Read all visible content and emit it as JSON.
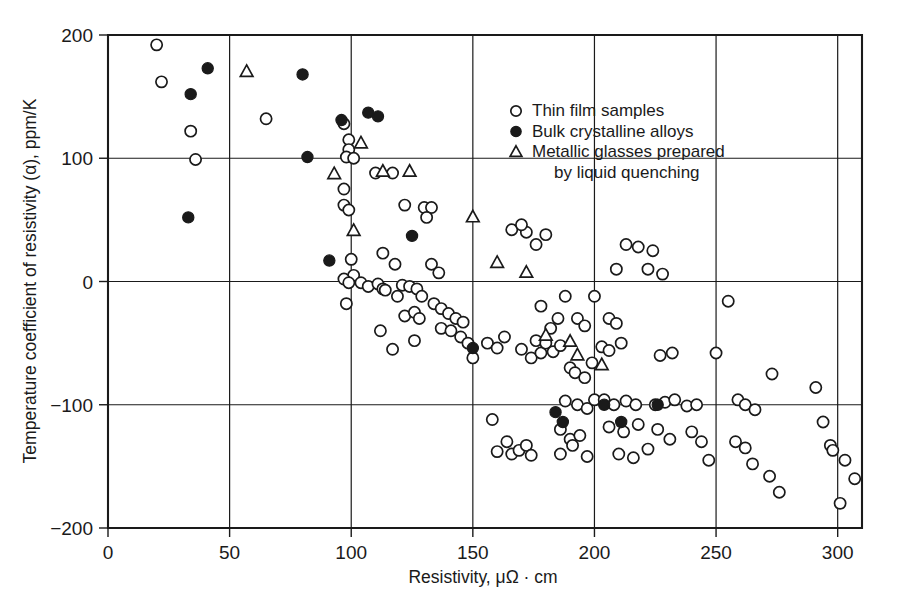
{
  "chart_data": {
    "type": "scatter",
    "title": "",
    "xlabel": "Resistivity, μΩ · cm",
    "ylabel": "Temperature coefficient of resistivity (α), ppm/K",
    "xlim": [
      0,
      310
    ],
    "ylim": [
      -200,
      200
    ],
    "xticks": [
      0,
      50,
      100,
      150,
      200,
      250,
      300
    ],
    "xtick_labels": [
      "0",
      "50",
      "100",
      "150",
      "200",
      "250",
      "300"
    ],
    "yticks": [
      -200,
      -100,
      0,
      100,
      200
    ],
    "ytick_labels": [
      "−200",
      "−100",
      "0",
      "100",
      "200"
    ],
    "grid": true,
    "grid_x": [
      50,
      100,
      150,
      200,
      250,
      300
    ],
    "grid_y": [
      -100,
      0,
      100
    ],
    "legend_position": "upper right",
    "series": [
      {
        "name": "Thin film samples",
        "marker": "open-circle",
        "points": [
          [
            20,
            192
          ],
          [
            22,
            162
          ],
          [
            34,
            122
          ],
          [
            36,
            99
          ],
          [
            65,
            132
          ],
          [
            97,
            128
          ],
          [
            99,
            115
          ],
          [
            99,
            107
          ],
          [
            98,
            101
          ],
          [
            101,
            100
          ],
          [
            97,
            75
          ],
          [
            97,
            62
          ],
          [
            99,
            58
          ],
          [
            100,
            18
          ],
          [
            101,
            5
          ],
          [
            97,
            2
          ],
          [
            99,
            -1
          ],
          [
            104,
            -1
          ],
          [
            98,
            -18
          ],
          [
            107,
            -4
          ],
          [
            111,
            -2
          ],
          [
            113,
            -6
          ],
          [
            110,
            88
          ],
          [
            117,
            88
          ],
          [
            113,
            23
          ],
          [
            118,
            14
          ],
          [
            114,
            -7
          ],
          [
            119,
            -12
          ],
          [
            121,
            -3
          ],
          [
            124,
            -4
          ],
          [
            127,
            -6
          ],
          [
            129,
            -12
          ],
          [
            122,
            62
          ],
          [
            130,
            60
          ],
          [
            133,
            60
          ],
          [
            131,
            52
          ],
          [
            122,
            -28
          ],
          [
            126,
            -25
          ],
          [
            128,
            -30
          ],
          [
            133,
            14
          ],
          [
            136,
            7
          ],
          [
            134,
            -18
          ],
          [
            137,
            -22
          ],
          [
            140,
            -26
          ],
          [
            143,
            -30
          ],
          [
            146,
            -33
          ],
          [
            126,
            -48
          ],
          [
            137,
            -38
          ],
          [
            141,
            -40
          ],
          [
            145,
            -45
          ],
          [
            148,
            -50
          ],
          [
            150,
            -62
          ],
          [
            117,
            -55
          ],
          [
            112,
            -40
          ],
          [
            156,
            -50
          ],
          [
            160,
            -54
          ],
          [
            163,
            -45
          ],
          [
            158,
            -112
          ],
          [
            164,
            -130
          ],
          [
            160,
            -138
          ],
          [
            166,
            -140
          ],
          [
            169,
            -137
          ],
          [
            172,
            -133
          ],
          [
            174,
            -141
          ],
          [
            170,
            -55
          ],
          [
            176,
            -48
          ],
          [
            174,
            -62
          ],
          [
            178,
            -58
          ],
          [
            180,
            -50
          ],
          [
            183,
            -57
          ],
          [
            186,
            -52
          ],
          [
            185,
            -30
          ],
          [
            182,
            -38
          ],
          [
            178,
            -20
          ],
          [
            188,
            -12
          ],
          [
            193,
            -30
          ],
          [
            196,
            -36
          ],
          [
            190,
            -70
          ],
          [
            192,
            -74
          ],
          [
            196,
            -78
          ],
          [
            199,
            -66
          ],
          [
            188,
            -97
          ],
          [
            193,
            -100
          ],
          [
            197,
            -103
          ],
          [
            200,
            -96
          ],
          [
            186,
            -120
          ],
          [
            190,
            -128
          ],
          [
            194,
            -125
          ],
          [
            191,
            -133
          ],
          [
            186,
            -140
          ],
          [
            197,
            -142
          ],
          [
            200,
            -12
          ],
          [
            206,
            -30
          ],
          [
            209,
            -34
          ],
          [
            203,
            -53
          ],
          [
            206,
            -56
          ],
          [
            211,
            -50
          ],
          [
            204,
            -96
          ],
          [
            208,
            -100
          ],
          [
            213,
            -97
          ],
          [
            217,
            -100
          ],
          [
            206,
            -118
          ],
          [
            212,
            -122
          ],
          [
            218,
            -116
          ],
          [
            210,
            -140
          ],
          [
            216,
            -143
          ],
          [
            222,
            -136
          ],
          [
            225,
            -100
          ],
          [
            229,
            -98
          ],
          [
            233,
            -96
          ],
          [
            226,
            -120
          ],
          [
            231,
            -128
          ],
          [
            238,
            -101
          ],
          [
            242,
            -100
          ],
          [
            227,
            -60
          ],
          [
            232,
            -58
          ],
          [
            240,
            -122
          ],
          [
            244,
            -130
          ],
          [
            247,
            -145
          ],
          [
            250,
            -58
          ],
          [
            259,
            -96
          ],
          [
            262,
            -100
          ],
          [
            266,
            -104
          ],
          [
            258,
            -130
          ],
          [
            262,
            -135
          ],
          [
            265,
            -148
          ],
          [
            273,
            -75
          ],
          [
            272,
            -158
          ],
          [
            276,
            -171
          ],
          [
            291,
            -86
          ],
          [
            294,
            -114
          ],
          [
            297,
            -133
          ],
          [
            298,
            -137
          ],
          [
            301,
            -180
          ],
          [
            303,
            -145
          ],
          [
            307,
            -160
          ],
          [
            255,
            -16
          ],
          [
            209,
            10
          ],
          [
            222,
            10
          ],
          [
            228,
            6
          ],
          [
            213,
            30
          ],
          [
            218,
            28
          ],
          [
            224,
            25
          ],
          [
            176,
            30
          ],
          [
            172,
            40
          ],
          [
            180,
            38
          ],
          [
            166,
            42
          ],
          [
            170,
            46
          ]
        ]
      },
      {
        "name": "Bulk crystalline alloys",
        "marker": "filled-circle",
        "points": [
          [
            34,
            152
          ],
          [
            41,
            173
          ],
          [
            33,
            52
          ],
          [
            80,
            168
          ],
          [
            82,
            101
          ],
          [
            91,
            17
          ],
          [
            96,
            131
          ],
          [
            107,
            137
          ],
          [
            111,
            134
          ],
          [
            125,
            37
          ],
          [
            150,
            -54
          ],
          [
            184,
            -106
          ],
          [
            187,
            -114
          ],
          [
            204,
            -100
          ],
          [
            211,
            -114
          ],
          [
            226,
            -100
          ]
        ]
      },
      {
        "name": "Metallic glasses prepared by liquid quenching",
        "marker": "open-triangle",
        "points": [
          [
            57,
            170
          ],
          [
            93,
            87
          ],
          [
            104,
            112
          ],
          [
            101,
            41
          ],
          [
            113,
            89
          ],
          [
            124,
            89
          ],
          [
            150,
            52
          ],
          [
            160,
            15
          ],
          [
            172,
            7
          ],
          [
            180,
            -44
          ],
          [
            190,
            -49
          ],
          [
            193,
            -60
          ],
          [
            203,
            -68
          ]
        ]
      }
    ]
  },
  "legend": {
    "items": [
      {
        "marker": "open-circle",
        "label": "Thin film samples"
      },
      {
        "marker": "filled-circle",
        "label": "Bulk crystalline alloys"
      },
      {
        "marker": "open-triangle",
        "label": "Metallic glasses prepared"
      },
      {
        "marker": "none",
        "label": "by liquid quenching"
      }
    ]
  },
  "colors": {
    "ink": "#1a1a1a",
    "paper": "#ffffff",
    "marker_fill": "#ffffff"
  },
  "caption_strip": ""
}
